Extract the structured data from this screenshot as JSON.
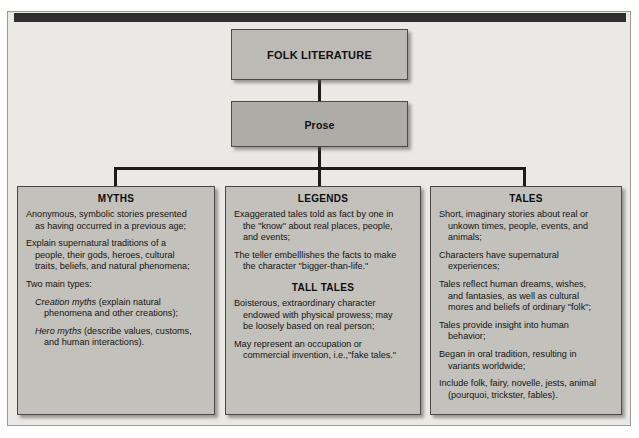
{
  "diagram": {
    "root": {
      "label": "FOLK LITERATURE"
    },
    "second": {
      "label": "Prose"
    },
    "branches": [
      {
        "id": "myths",
        "heading": "MYTHS",
        "entries": [
          {
            "lines": [
              "Anonymous, symbolic stories presented",
              "as having occurred in a previous age;"
            ],
            "indented": false
          },
          {
            "lines": [
              "Explain supernatural traditions of a",
              "people, their gods, heroes, cultural",
              "traits, beliefs, and natural phenomena;"
            ],
            "indented": false
          },
          {
            "lines": [
              "Two main types:"
            ],
            "indented": false
          },
          {
            "emphasis": "Creation myths",
            "lines": [
              " (explain natural",
              "phenomena and other creations);"
            ],
            "indented": true
          },
          {
            "emphasis": "Hero myths",
            "lines": [
              " (describe values, customs,",
              "and human interactions)."
            ],
            "indented": true
          }
        ]
      },
      {
        "id": "legends",
        "heading": "LEGENDS",
        "entries": [
          {
            "lines": [
              "Exaggerated tales told as fact by one in",
              "the \"know\" about real places, people,",
              "and events;"
            ],
            "indented": false
          },
          {
            "lines": [
              "The teller embelllishes the facts to make",
              "the character \"bigger-than-life.\""
            ],
            "indented": false
          }
        ],
        "subheading": "TALL TALES",
        "sub_entries": [
          {
            "lines": [
              "Boisterous, extraordinary character",
              "endowed with physical prowess; may",
              "be loosely based on real person;"
            ],
            "indented": false
          },
          {
            "lines": [
              "May represent an occupation or",
              "commercial invention, i.e.,\"fake tales.\""
            ],
            "indented": false
          }
        ]
      },
      {
        "id": "tales",
        "heading": "TALES",
        "entries": [
          {
            "lines": [
              "Short, imaginary stories about real or",
              "unkown times, people, events, and",
              "animals;"
            ],
            "indented": false
          },
          {
            "lines": [
              "Characters have supernatural",
              "experiences;"
            ],
            "indented": false
          },
          {
            "lines": [
              "Tales reflect human dreams, wishes,",
              "and fantasies, as well as cultural",
              "mores and beliefs of ordinary \"folk\";"
            ],
            "indented": false
          },
          {
            "lines": [
              "Tales provide insight into human",
              "behavior;"
            ],
            "indented": false
          },
          {
            "lines": [
              "Began in oral tradition, resulting in",
              "variants worldwide;"
            ],
            "indented": false
          },
          {
            "lines": [
              "Include folk, fairy, novelle, jests, animal",
              "(pourquoi, trickster, fables)."
            ],
            "indented": false
          }
        ]
      }
    ]
  },
  "colors": {
    "page_background": "#ffffff",
    "frame_background": "#ebe9e6",
    "header_bar": "#2e2e2e",
    "node_top": "#bcbab5",
    "node_second": "#aeaca7",
    "node_leaf": "#c3c1bc",
    "connector": "#1c1c1c",
    "text": "#14140f"
  }
}
